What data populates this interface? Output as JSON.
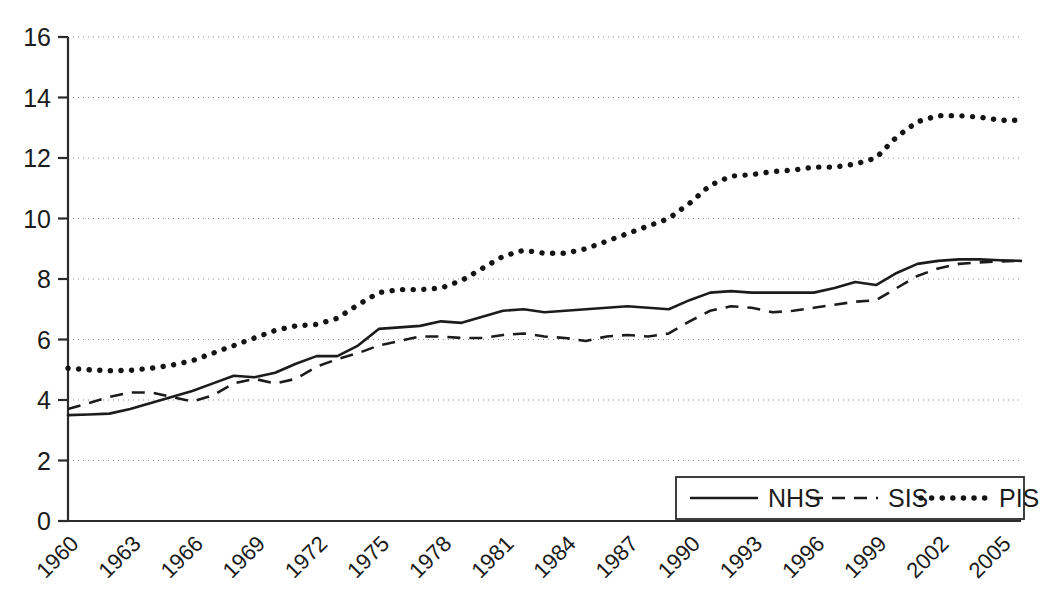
{
  "chart_data": {
    "type": "line",
    "title": "",
    "subtitle": "",
    "xlabel": "",
    "ylabel": "",
    "xlim": [
      1960,
      2006
    ],
    "ylim": [
      0,
      16
    ],
    "ytick_values": [
      0,
      2,
      4,
      6,
      8,
      10,
      12,
      14,
      16
    ],
    "ytick_labels": [
      "0",
      "2",
      "4",
      "6",
      "8",
      "10",
      "12",
      "14",
      "16"
    ],
    "xtick_values": [
      1960,
      1963,
      1966,
      1969,
      1972,
      1975,
      1978,
      1981,
      1984,
      1987,
      1990,
      1993,
      1996,
      1999,
      2002,
      2005
    ],
    "xtick_labels": [
      "1960",
      "1963",
      "1966",
      "1969",
      "1972",
      "1975",
      "1978",
      "1981",
      "1984",
      "1987",
      "1990",
      "1993",
      "1996",
      "1999",
      "2002",
      "2005"
    ],
    "xtick_rotation": -45,
    "grid": "horizontal-dotted",
    "legend_position": "bottom-right",
    "legend_entries": [
      {
        "label": "NHS",
        "style": "solid"
      },
      {
        "label": "SIS",
        "style": "dashed"
      },
      {
        "label": "PIS",
        "style": "dotted"
      }
    ],
    "x": [
      1960,
      1961,
      1962,
      1963,
      1964,
      1965,
      1966,
      1967,
      1968,
      1969,
      1970,
      1971,
      1972,
      1973,
      1974,
      1975,
      1976,
      1977,
      1978,
      1979,
      1980,
      1981,
      1982,
      1983,
      1984,
      1985,
      1986,
      1987,
      1988,
      1989,
      1990,
      1991,
      1992,
      1993,
      1994,
      1995,
      1996,
      1997,
      1998,
      1999,
      2000,
      2001,
      2002,
      2003,
      2004,
      2005,
      2006
    ],
    "series": [
      {
        "name": "NHS",
        "style": "solid",
        "color": "#1c1c1c",
        "values": [
          3.5,
          3.52,
          3.55,
          3.7,
          3.9,
          4.1,
          4.3,
          4.55,
          4.8,
          4.75,
          4.9,
          5.2,
          5.45,
          5.45,
          5.8,
          6.35,
          6.4,
          6.45,
          6.6,
          6.55,
          6.75,
          6.95,
          7.0,
          6.9,
          6.95,
          7.0,
          7.05,
          7.1,
          7.05,
          7.0,
          7.3,
          7.55,
          7.6,
          7.55,
          7.55,
          7.55,
          7.55,
          7.7,
          7.9,
          7.8,
          8.2,
          8.5,
          8.6,
          8.65,
          8.65,
          8.62,
          8.6
        ]
      },
      {
        "name": "SIS",
        "style": "dashed",
        "color": "#1c1c1c",
        "values": [
          3.7,
          3.9,
          4.1,
          4.25,
          4.25,
          4.1,
          3.95,
          4.15,
          4.55,
          4.7,
          4.55,
          4.7,
          5.1,
          5.35,
          5.55,
          5.8,
          5.95,
          6.1,
          6.1,
          6.05,
          6.05,
          6.15,
          6.2,
          6.1,
          6.05,
          5.95,
          6.1,
          6.15,
          6.1,
          6.2,
          6.6,
          6.95,
          7.1,
          7.05,
          6.9,
          6.95,
          7.05,
          7.15,
          7.25,
          7.3,
          7.7,
          8.1,
          8.35,
          8.5,
          8.55,
          8.58,
          8.6
        ]
      },
      {
        "name": "PIS",
        "style": "dotted",
        "color": "#141414",
        "values": [
          5.05,
          5.0,
          4.97,
          4.98,
          5.05,
          5.15,
          5.3,
          5.55,
          5.8,
          6.05,
          6.3,
          6.45,
          6.5,
          6.7,
          7.15,
          7.55,
          7.65,
          7.65,
          7.7,
          7.95,
          8.35,
          8.75,
          8.95,
          8.85,
          8.85,
          9.0,
          9.25,
          9.5,
          9.75,
          10.0,
          10.5,
          11.1,
          11.4,
          11.45,
          11.55,
          11.6,
          11.7,
          11.7,
          11.8,
          12.0,
          12.7,
          13.2,
          13.4,
          13.4,
          13.35,
          13.25,
          13.25
        ]
      }
    ]
  },
  "axis": {
    "y_label_font_size": "25px",
    "x_label_font_size": "22px"
  }
}
